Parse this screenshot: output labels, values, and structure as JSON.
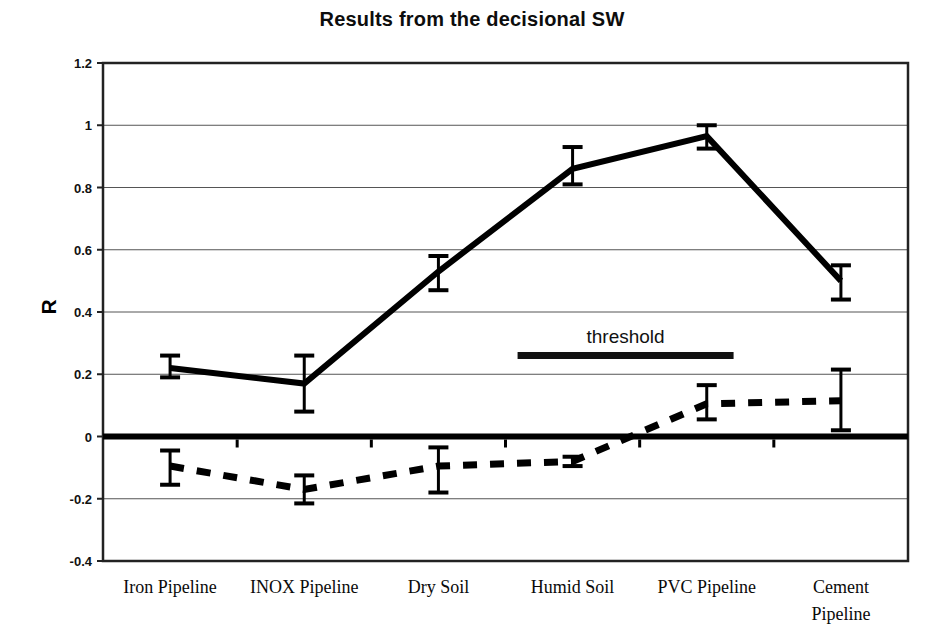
{
  "chart_data": {
    "type": "line",
    "title": "Results from the decisional SW",
    "xlabel": "",
    "ylabel": "R",
    "ylim": [
      -0.4,
      1.2
    ],
    "yticks": [
      -0.4,
      -0.2,
      0,
      0.2,
      0.4,
      0.6,
      0.8,
      1,
      1.2
    ],
    "ytick_labels": [
      "-0.4",
      "-0.2",
      "0",
      "0.2",
      "0.4",
      "0.6",
      "0.8",
      "1",
      "1.2"
    ],
    "grid": true,
    "legend": "none",
    "categories": [
      "Iron Pipeline",
      "INOX Pipeline",
      "Dry Soil",
      "Humid Soil",
      "PVC Pipeline",
      "Cement Pipeline"
    ],
    "category_label_lines": [
      [
        "Iron Pipeline"
      ],
      [
        "INOX Pipeline"
      ],
      [
        "Dry Soil"
      ],
      [
        "Humid Soil"
      ],
      [
        "PVC Pipeline"
      ],
      [
        "Cement",
        "Pipeline"
      ]
    ],
    "series": [
      {
        "name": "solid",
        "style": "solid",
        "values": [
          0.22,
          0.17,
          0.53,
          0.86,
          0.965,
          0.5
        ],
        "err_low": [
          0.19,
          0.08,
          0.47,
          0.81,
          0.925,
          0.44
        ],
        "err_high": [
          0.26,
          0.26,
          0.58,
          0.93,
          1.0,
          0.55
        ]
      },
      {
        "name": "dashed",
        "style": "dashed",
        "values": [
          -0.095,
          -0.17,
          -0.095,
          -0.08,
          0.105,
          0.115
        ],
        "err_low": [
          -0.155,
          -0.215,
          -0.18,
          -0.095,
          0.055,
          0.02
        ],
        "err_high": [
          -0.045,
          -0.125,
          -0.035,
          -0.065,
          0.165,
          0.215
        ]
      }
    ],
    "annotations": [
      {
        "name": "threshold",
        "label": "threshold",
        "value": 0.26,
        "x_start_category_fraction": 3.09,
        "x_end_category_fraction": 4.7
      }
    ]
  }
}
